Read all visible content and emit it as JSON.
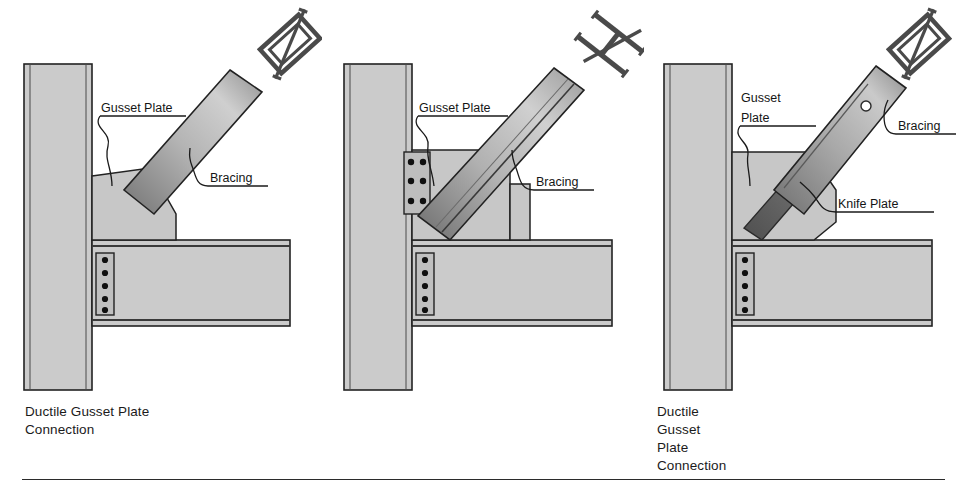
{
  "figure": {
    "type": "engineering-detail-drawing",
    "panel_count": 3,
    "separator_rule": true
  },
  "panels": [
    {
      "id": "panel-1",
      "caption": "Ductile Gusset Plate\nConnection",
      "caption_line_1": "Ductile Gusset Plate",
      "caption_line_2": "Connection",
      "section_symbol": "hss-tube-section-icon",
      "labels": [
        {
          "name": "gusset-plate-label",
          "text": "Gusset Plate"
        },
        {
          "name": "bracing-label",
          "text": "Bracing"
        }
      ],
      "members": {
        "column": "wide-flange-column",
        "beam": "wide-flange-beam",
        "gusset": "tapered-gusset-plate-welded",
        "brace": "hss-brace",
        "beam_bolts": 5,
        "beam_bolt_columns": 1,
        "gusset_bolts": 0
      }
    },
    {
      "id": "panel-2",
      "caption": "Ductile Gusset Plate\nConnection",
      "caption_line_1": "Ductile Gusset Plate",
      "caption_line_2": "Connection",
      "section_symbol": "wide-flange-section-icon",
      "labels": [
        {
          "name": "gusset-plate-label",
          "text": "Gusset Plate"
        },
        {
          "name": "bracing-label",
          "text": "Bracing"
        }
      ],
      "members": {
        "column": "wide-flange-column",
        "beam": "wide-flange-beam",
        "gusset": "rectangular-gusset-plate-bolted",
        "brace": "wide-flange-brace",
        "beam_bolts": 5,
        "beam_bolt_columns": 1,
        "gusset_bolts": 6,
        "gusset_bolt_rows": 3,
        "gusset_bolt_columns": 2
      }
    },
    {
      "id": "panel-3",
      "caption": "Ductile Knife Plate Connection",
      "caption_line_1": "Ductile Knife Plate Connection",
      "caption_line_2": "",
      "section_symbol": "hss-tube-section-icon",
      "labels": [
        {
          "name": "gusset-plate-label",
          "text": "Gusset\nPlate"
        },
        {
          "name": "gusset-plate-label-line-1",
          "text": "Gusset"
        },
        {
          "name": "gusset-plate-label-line-2",
          "text": "Plate"
        },
        {
          "name": "bracing-label",
          "text": "Bracing"
        },
        {
          "name": "knife-plate-label",
          "text": "Knife Plate"
        }
      ],
      "members": {
        "column": "wide-flange-column",
        "beam": "wide-flange-beam",
        "gusset": "tapered-gusset-plate-welded",
        "brace": "hss-brace-slotted",
        "knife_plate": "knife-plate-with-bolt-hole",
        "brace_bolt_holes": 1,
        "beam_bolts": 5,
        "beam_bolt_columns": 1
      }
    }
  ],
  "colors": {
    "steel_fill": "#c9c9c9",
    "steel_fill_light": "#d2d2d2",
    "outline": "#222222",
    "brace_gradient_dark": "#6f6f6f",
    "brace_gradient_light": "#d8d8d8",
    "knife_plate_dark": "#5f5f5f",
    "bolt": "#101010",
    "leader_line": "#1a1a1a",
    "text": "#1b1b1b",
    "background": "#ffffff"
  }
}
